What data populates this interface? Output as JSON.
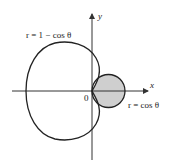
{
  "diagram": {
    "type": "polar-curves",
    "axes": {
      "x_label": "x",
      "y_label": "y",
      "origin_label": "0"
    },
    "curves": [
      {
        "name": "cardioid",
        "equation": "r = 1 − cos θ"
      },
      {
        "name": "circle",
        "equation": "r = cos θ"
      }
    ],
    "shaded_region": "inside r = cos θ and outside r = 1 − cos θ",
    "colors": {
      "stroke": "#222222",
      "shade": "#cfcfcf",
      "axis": "#333333"
    }
  }
}
